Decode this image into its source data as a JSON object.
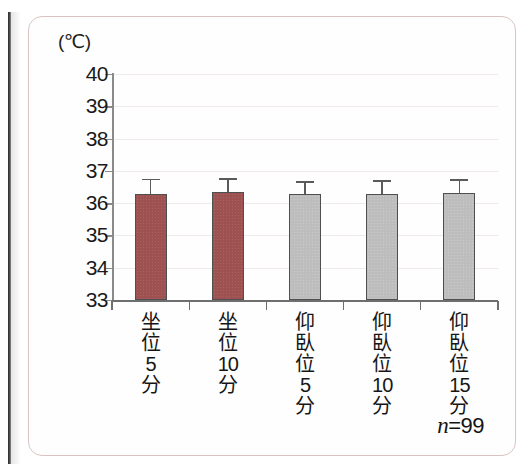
{
  "figure": {
    "unit_label": "(℃)",
    "sample_note_variable": "n",
    "sample_note_equals": "=",
    "sample_note_value": "99",
    "frame_color": "#d9c3c3",
    "background": "#ffffff"
  },
  "chart_data": {
    "type": "bar",
    "title": "",
    "xlabel": "",
    "ylabel": "(℃)",
    "ylim": [
      33,
      40
    ],
    "yticks": [
      33,
      34,
      35,
      36,
      37,
      38,
      39,
      40
    ],
    "ytick_labels": [
      "33",
      "34",
      "35",
      "36",
      "37",
      "38",
      "39",
      "40"
    ],
    "grid": true,
    "legend": "none",
    "categories": [
      "坐位5分",
      "坐位10分",
      "仰臥位5分",
      "仰臥位10分",
      "仰臥位15分"
    ],
    "category_lines": [
      [
        "坐",
        "位",
        "5",
        "分"
      ],
      [
        "坐",
        "位",
        "10",
        "分"
      ],
      [
        "仰",
        "臥",
        "位",
        "5",
        "分"
      ],
      [
        "仰",
        "臥",
        "位",
        "10",
        "分"
      ],
      [
        "仰",
        "臥",
        "位",
        "15",
        "分"
      ]
    ],
    "values": [
      36.28,
      36.33,
      36.28,
      36.29,
      36.32
    ],
    "errors": [
      0.48,
      0.45,
      0.4,
      0.42,
      0.42
    ],
    "bar_colors": [
      "#9e5151",
      "#9e5151",
      "#bdbdbd",
      "#bdbdbd",
      "#bdbdbd"
    ],
    "bar_color_names": [
      "dark-red",
      "dark-red",
      "gray",
      "gray",
      "gray"
    ],
    "annotation": "n=99"
  },
  "colors": {
    "bar_red": "#9e5151",
    "bar_gray": "#bdbdbd",
    "axis": "#6e6e6e",
    "gridline": "#efe9ea",
    "text": "#161616"
  }
}
